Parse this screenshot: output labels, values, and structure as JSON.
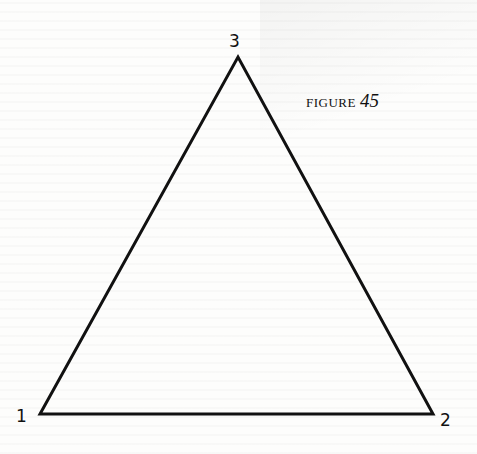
{
  "figure": {
    "caption_word": "FIGURE",
    "caption_number": "45",
    "shape": "triangle",
    "vertices": [
      {
        "id": "1",
        "label": "1",
        "x": 40,
        "y": 414
      },
      {
        "id": "2",
        "label": "2",
        "x": 433,
        "y": 414
      },
      {
        "id": "3",
        "label": "3",
        "x": 238,
        "y": 57
      }
    ],
    "stroke_color": "#111111",
    "stroke_width": 3
  }
}
